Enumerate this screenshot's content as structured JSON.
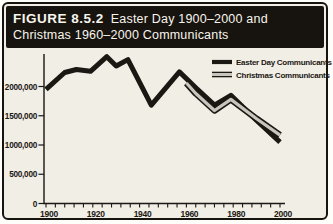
{
  "figure": {
    "label": "FIGURE 8.5.2",
    "title_line1": "Easter Day 1900–2000 and",
    "title_line2": "Christmas 1960–2000 Communicants"
  },
  "colors": {
    "ink": "#1b1713",
    "paper": "#f1eee6",
    "header_bg": "#17130e",
    "header_text": "#f7f5ed",
    "gray_line_core": "#c8c5bf"
  },
  "chart_data": {
    "type": "line",
    "title": "Easter Day 1900–2000 and Christmas 1960–2000 Communicants",
    "xlabel": "",
    "ylabel": "",
    "xlim": [
      1900,
      2000
    ],
    "ylim": [
      0,
      2550000
    ],
    "grid": false,
    "legend_position": "top-right",
    "x_ticks_labeled": [
      1900,
      1920,
      1940,
      1960,
      1980,
      2000
    ],
    "x_minor_tick_step_years": 4,
    "y_ticks": [
      {
        "value": 0,
        "label": "0"
      },
      {
        "value": 500000,
        "label": "500,000"
      },
      {
        "value": 1000000,
        "label": "1000,000"
      },
      {
        "value": 1500000,
        "label": "1500,000"
      },
      {
        "value": 2000000,
        "label": "2000,000"
      }
    ],
    "series": [
      {
        "name": "Easter Day Communicants",
        "style": "thick-solid",
        "color": "#1b1713",
        "points": [
          [
            1900,
            1950000
          ],
          [
            1908,
            2240000
          ],
          [
            1913,
            2290000
          ],
          [
            1919,
            2260000
          ],
          [
            1926,
            2510000
          ],
          [
            1930,
            2350000
          ],
          [
            1935,
            2460000
          ],
          [
            1945,
            1680000
          ],
          [
            1957,
            2250000
          ],
          [
            1964,
            1980000
          ],
          [
            1972,
            1680000
          ],
          [
            1979,
            1850000
          ],
          [
            1990,
            1420000
          ],
          [
            2000,
            1050000
          ]
        ]
      },
      {
        "name": "Christmas Communicants",
        "style": "outlined-gray",
        "color": "#c8c5bf",
        "outline": "#1b1713",
        "points": [
          [
            1960,
            2060000
          ],
          [
            1964,
            1880000
          ],
          [
            1972,
            1590000
          ],
          [
            1979,
            1780000
          ],
          [
            1990,
            1450000
          ],
          [
            2000,
            1170000
          ]
        ]
      }
    ]
  }
}
